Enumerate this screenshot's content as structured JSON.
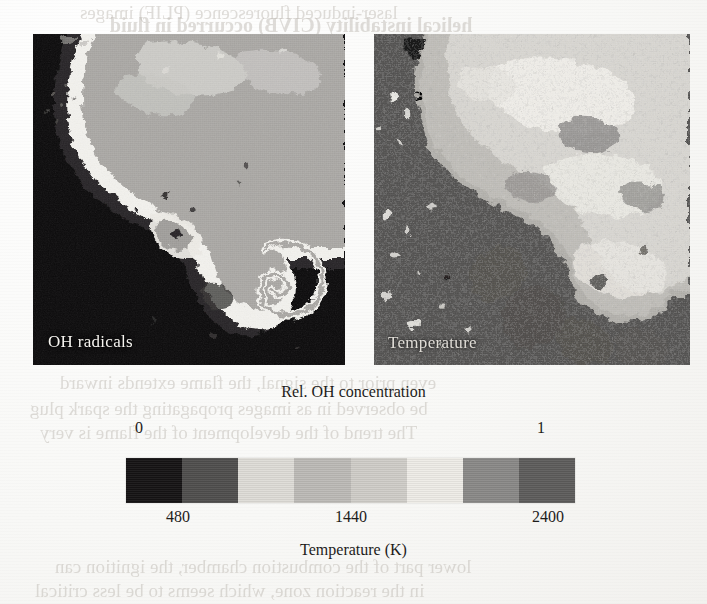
{
  "figure": {
    "kind": "scanned-journal-figure",
    "caption_top": "Rel. OH concentration",
    "axis_title": "Temperature (K)"
  },
  "panels": [
    {
      "id": "oh-radicals",
      "label": "OH radicals",
      "quantity": "Rel. OH concentration",
      "description": "Planar laser-induced fluorescence image of OH radical distribution showing a mushroom-shaped plume with a roll-up vortex on the lower right",
      "background_tone": "#100f10",
      "plume_tone": "#a9a7a4",
      "rim_tone": "#e8e6e2"
    },
    {
      "id": "temperature",
      "label": "Temperature",
      "quantity": "Temperature (K)",
      "description": "Corresponding temperature field image, speckled mid-gray background with lighter hot-product region",
      "background_tone": "#555453",
      "plume_tone": "#d8d6d1",
      "rim_tone": "#f0eeea"
    }
  ],
  "colorbar": {
    "orientation": "horizontal",
    "n_bands": 8,
    "bands": [
      {
        "index": 0,
        "hex": "#151314"
      },
      {
        "index": 1,
        "hex": "#4f4e4d"
      },
      {
        "index": 2,
        "hex": "#dedcd7"
      },
      {
        "index": 3,
        "hex": "#bcbab6"
      },
      {
        "index": 4,
        "hex": "#cfcdc8"
      },
      {
        "index": 5,
        "hex": "#eeece7"
      },
      {
        "index": 6,
        "hex": "#8a8987"
      },
      {
        "index": 7,
        "hex": "#5d5c5b"
      }
    ],
    "top_ticks": [
      {
        "label": "0",
        "position_fraction": 0.025
      },
      {
        "label": "1",
        "position_fraction": 0.92
      }
    ],
    "bottom_ticks": [
      {
        "label": "480",
        "position_fraction": 0.115
      },
      {
        "label": "1440",
        "position_fraction": 0.5
      },
      {
        "label": "2400",
        "position_fraction": 0.94
      }
    ]
  },
  "chart_data": {
    "type": "heatmap",
    "title": "",
    "subtitle": "",
    "panels": [
      {
        "name": "OH radicals",
        "colorbar_label": "Rel. OH concentration",
        "colorbar_ticks": [
          "0",
          "1"
        ],
        "value_range": [
          0,
          1
        ],
        "units": "relative"
      },
      {
        "name": "Temperature",
        "colorbar_label": "Temperature (K)",
        "colorbar_ticks": [
          "480",
          "1440",
          "2400"
        ],
        "value_range": [
          480,
          2400
        ],
        "units": "K"
      }
    ],
    "shared_colorbar": true,
    "colormap": "grayscale-8-level",
    "xlabel": "",
    "ylabel": "",
    "grid": false,
    "legend": "shared horizontal colorbar below panels"
  },
  "ghost_text": {
    "line1": "laser-induced fluorescence (PLIF) images",
    "line2": "helical instability (CIVB) occurred in fluid",
    "line3": "even prior to the signal, the flame extends inward",
    "line4": "be observed in as images propagating the spark plug",
    "line5": "The trend of the development of the flame is very",
    "line6": "lower part of the combustion chamber, the ignition can",
    "line7": "in the reaction zone, which seems to be less critical"
  }
}
